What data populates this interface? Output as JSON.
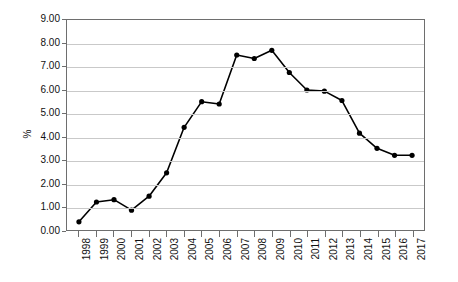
{
  "chart_data": {
    "type": "line",
    "title": "",
    "xlabel": "",
    "ylabel": "%",
    "categories": [
      "1998",
      "1999",
      "2000",
      "2001",
      "2002",
      "2003",
      "2004",
      "2005",
      "2006",
      "2007",
      "2008",
      "2009",
      "2010",
      "2011",
      "2012",
      "2013",
      "2014",
      "2015",
      "2016",
      "2017"
    ],
    "values": [
      0.35,
      1.2,
      1.3,
      0.85,
      1.45,
      2.45,
      4.4,
      5.5,
      5.4,
      7.5,
      7.35,
      7.7,
      6.75,
      6.0,
      5.95,
      5.55,
      4.15,
      3.5,
      3.2,
      3.2
    ],
    "ylim": [
      0,
      9
    ],
    "ytick_step": 1,
    "ytick_labels": [
      "0.00",
      "1.00",
      "2.00",
      "3.00",
      "4.00",
      "5.00",
      "6.00",
      "7.00",
      "8.00",
      "9.00"
    ],
    "ytick_values": [
      0,
      1,
      2,
      3,
      4,
      5,
      6,
      7,
      8,
      9
    ],
    "grid": true,
    "grid_axis": "y",
    "legend": false,
    "legend_position": "none",
    "marker": "circle",
    "line_color": "#000000",
    "marker_color": "#000000",
    "grid_color": "#c9c9c9",
    "axis_color": "#6e6e6e",
    "background": "#ffffff",
    "xtick_rotation": -90,
    "series": [
      {
        "name": "%",
        "values": [
          0.35,
          1.2,
          1.3,
          0.85,
          1.45,
          2.45,
          4.4,
          5.5,
          5.4,
          7.5,
          7.35,
          7.7,
          6.75,
          6.0,
          5.95,
          5.55,
          4.15,
          3.5,
          3.2,
          3.2
        ]
      }
    ]
  }
}
